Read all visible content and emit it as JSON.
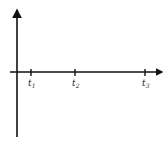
{
  "diagram": {
    "type": "timeline-axes",
    "colors": {
      "stroke": "#111111",
      "text": "#222222"
    },
    "ticks": [
      {
        "label": "t",
        "subscript": "1"
      },
      {
        "label": "t",
        "subscript": "2"
      },
      {
        "label": "t",
        "subscript": "3"
      }
    ]
  }
}
